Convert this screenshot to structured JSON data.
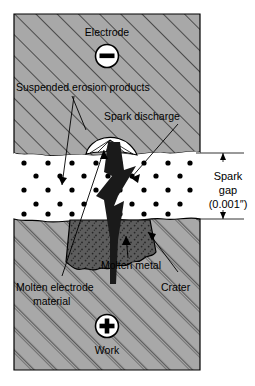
{
  "figure": {
    "labels": {
      "electrode": "Electrode",
      "suspended_erosion_products": "Suspended erosion products",
      "spark_discharge": "Spark discharge",
      "spark_gap_line1": "Spark",
      "spark_gap_line2": "gap",
      "spark_gap_line3": "(0.001″)",
      "molten_metal": "Molten metal",
      "molten_electrode_line1": "Molten electrode",
      "molten_electrode_line2": "material",
      "crater": "Crater",
      "work": "Work"
    },
    "terminals": {
      "electrode_polarity": "−",
      "work_polarity": "+"
    },
    "measurements": {
      "spark_gap_value": "0.001″"
    },
    "colors": {
      "hatched_fill": "#a8a8a8",
      "hatch_line": "#2b2b2b",
      "dielectric_fill": "#ffffff",
      "particle": "#000000",
      "crater_fill": "#595959",
      "spark_bolt": "#1a1a1a",
      "outline": "#000000",
      "page_background": "#ffffff"
    }
  }
}
